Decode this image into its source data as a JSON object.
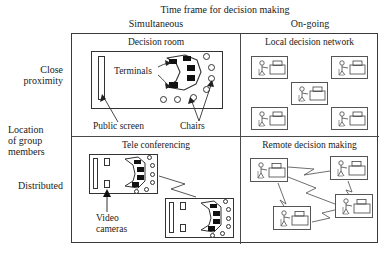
{
  "diagram": {
    "title": "Time frame for decision making",
    "column_axis_label": "Time frame for decision making",
    "row_axis_label_lines": [
      "Location",
      "of group",
      "members"
    ],
    "columns": [
      {
        "key": "simultaneous",
        "label": "Simultaneous"
      },
      {
        "key": "ongoing",
        "label": "On-going"
      }
    ],
    "rows": [
      {
        "key": "close",
        "label_lines": [
          "Close",
          "proximity"
        ],
        "label": "Close proximity"
      },
      {
        "key": "distributed",
        "label_lines": [
          "Distributed"
        ],
        "label": "Distributed"
      }
    ],
    "cells": [
      {
        "key": "decision-room",
        "row": "close",
        "column": "simultaneous",
        "title": "Decision room",
        "annotations": [
          {
            "key": "terminals",
            "text": "Terminals"
          },
          {
            "key": "public-screen",
            "text": "Public screen"
          },
          {
            "key": "chairs",
            "text": "Chairs"
          }
        ],
        "counts": {
          "terminals": 5,
          "chairs": 7,
          "public_screens": 1
        }
      },
      {
        "key": "local-decision-network",
        "row": "close",
        "column": "ongoing",
        "title": "Local decision network",
        "annotations": [],
        "counts": {
          "workstations": 5
        }
      },
      {
        "key": "tele-conferencing",
        "row": "distributed",
        "column": "simultaneous",
        "title": "Tele conferencing",
        "annotations": [
          {
            "key": "video-cameras",
            "text_lines": [
              "Video",
              "cameras"
            ],
            "text": "Video cameras"
          }
        ],
        "counts": {
          "rooms": 2,
          "video_cameras_per_room": 2,
          "terminals_per_room": 4,
          "chairs_per_room": 6
        }
      },
      {
        "key": "remote-decision-making",
        "row": "distributed",
        "column": "ongoing",
        "title": "Remote decision making",
        "annotations": [],
        "counts": {
          "workstations": 4,
          "links": 5
        }
      }
    ],
    "colors": {
      "background": "#ffffff",
      "line": "#3a3a3a",
      "text": "#1a1a1a",
      "terminal_fill": "#111111",
      "room_fill": "#ffffff"
    }
  }
}
